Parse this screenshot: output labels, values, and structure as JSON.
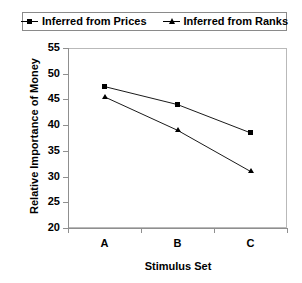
{
  "chart_data": {
    "type": "line",
    "title": "",
    "xlabel": "Stimulus Set",
    "ylabel": "Relative Importance of Money",
    "categories": [
      "A",
      "B",
      "C"
    ],
    "ylim": [
      20,
      55
    ],
    "yticks": [
      20,
      25,
      30,
      35,
      40,
      45,
      50,
      55
    ],
    "grid": false,
    "legend_position": "top",
    "series": [
      {
        "name": "Inferred from Prices",
        "marker": "square",
        "color": "#000000",
        "values": [
          47.5,
          44.0,
          38.5
        ]
      },
      {
        "name": "Inferred from Ranks",
        "marker": "triangle",
        "color": "#000000",
        "values": [
          45.5,
          39.0,
          31.0
        ]
      }
    ]
  },
  "legend": {
    "entries": [
      {
        "label": "Inferred from Prices",
        "marker": "square-marker-icon"
      },
      {
        "label": "Inferred from Ranks",
        "marker": "triangle-marker-icon"
      }
    ]
  },
  "axes": {
    "y": {
      "title": "Relative Importance of Money",
      "ticks": [
        "55",
        "50",
        "45",
        "40",
        "35",
        "30",
        "25",
        "20"
      ]
    },
    "x": {
      "title": "Stimulus Set",
      "ticks": [
        "A",
        "B",
        "C"
      ]
    }
  }
}
